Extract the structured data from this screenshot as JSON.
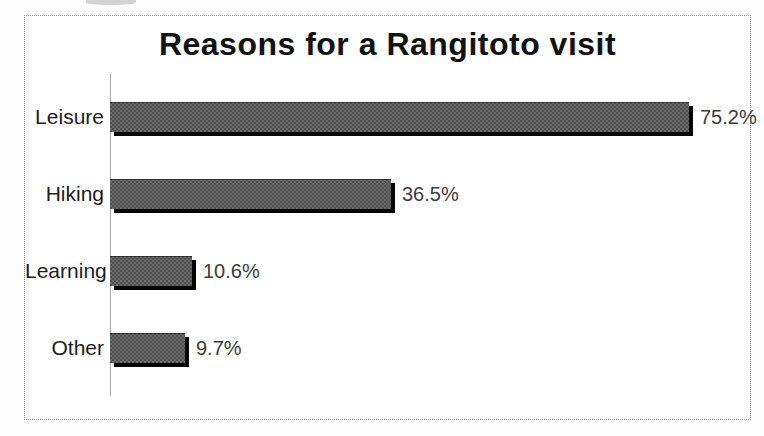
{
  "chart_data": {
    "type": "bar",
    "orientation": "horizontal",
    "title": "Reasons for a Rangitoto visit",
    "categories": [
      "Leisure",
      "Hiking",
      "Learning",
      "Other"
    ],
    "values": [
      75.2,
      36.5,
      10.6,
      9.7
    ],
    "value_labels": [
      "75.2%",
      "36.5%",
      "10.6%",
      "9.7%"
    ],
    "xlabel": "",
    "ylabel": "",
    "grid": false,
    "legend": false,
    "value_label_position": "right-of-bar",
    "colors": {
      "bar_fill": "#4e4e4e",
      "bar_texture_dot": "#6c6c6c",
      "bar_shadow": "#060606",
      "axis_line": "#a9a9a9",
      "frame_border": "#8f8f8f",
      "title_text": "#121212",
      "category_text": "#1c1c1c",
      "value_text": "#3c3c3c",
      "background": "#ffffff"
    }
  }
}
